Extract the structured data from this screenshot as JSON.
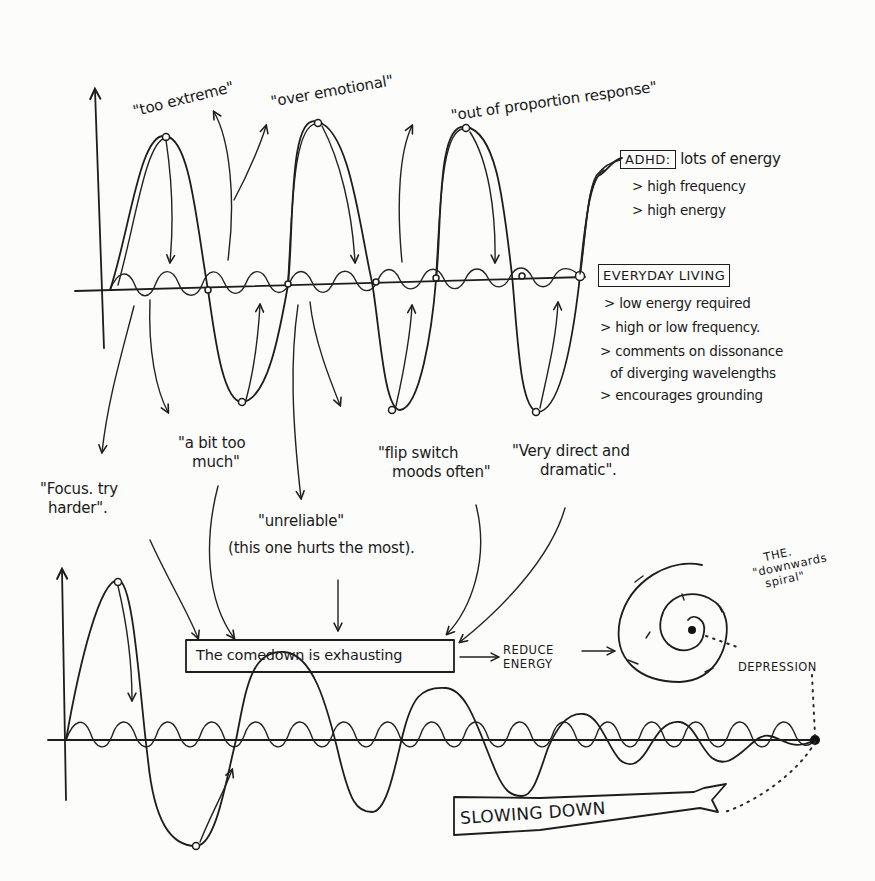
{
  "diagram": {
    "top_panel": {
      "quotes_above": [
        "\"too extreme\"",
        "\"over emotional\"",
        "\"out of proportion response\""
      ],
      "adhd_box": {
        "label": "ADHD:",
        "text": "lots of energy",
        "bullets": [
          "> high frequency",
          "> high energy"
        ]
      },
      "everyday_box": {
        "label": "EVERYDAY LIVING",
        "bullets": [
          "> low energy required",
          "> high or low frequency.",
          "> comments on dissonance",
          "of diverging wavelengths",
          "> encourages grounding"
        ]
      },
      "quotes_below": [
        {
          "line1": "\"Focus. try",
          "line2": "harder\"."
        },
        {
          "line1": "\"a bit too",
          "line2": "much\""
        },
        {
          "line1": "\"unreliable\"",
          "line2": "(this one hurts the most)."
        },
        {
          "line1": "\"flip switch",
          "line2": "moods often\""
        },
        {
          "line1": "\"Very direct and",
          "line2": "dramatic\"."
        }
      ]
    },
    "bottom_panel": {
      "comedown_box": "The comedown is exhausting",
      "reduce_energy": [
        "REDUCE",
        "ENERGY"
      ],
      "spiral_title": [
        "THE.",
        "\"downwards",
        "spiral\""
      ],
      "depression_label": "DEPRESSION",
      "slowing_down_label": "SLOWING DOWN"
    },
    "colors": {
      "ink": "#1d1d1d",
      "paper": "#fcfcfb"
    }
  }
}
